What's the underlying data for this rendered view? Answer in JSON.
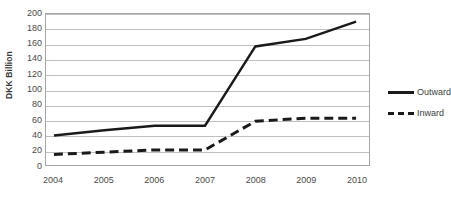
{
  "chart_data": {
    "type": "line",
    "title": "",
    "xlabel": "",
    "ylabel": "DKK Billion",
    "categories": [
      "2004",
      "2005",
      "2006",
      "2007",
      "2008",
      "2009",
      "2010"
    ],
    "series": [
      {
        "name": "Outward",
        "style": "solid",
        "color": "#1a1a1a",
        "values": [
          39,
          46,
          52,
          52,
          157,
          167,
          190
        ]
      },
      {
        "name": "Inward",
        "style": "dashed",
        "color": "#1a1a1a",
        "values": [
          14,
          17,
          20,
          20,
          58,
          62,
          62
        ]
      }
    ],
    "ylim": [
      0,
      200
    ],
    "ytick_step": 20,
    "yticks": [
      "200",
      "180",
      "160",
      "140",
      "120",
      "100",
      "80",
      "60",
      "40",
      "20",
      "0"
    ],
    "grid": true,
    "legend_position": "right"
  },
  "axis": {
    "y_title": "DKK Billion"
  },
  "legend": {
    "items": [
      {
        "label": "Outward"
      },
      {
        "label": "Inward"
      }
    ]
  }
}
